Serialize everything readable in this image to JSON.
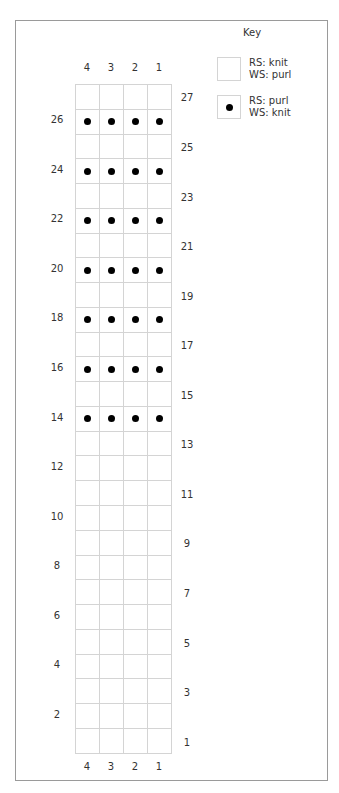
{
  "chart": {
    "columns": 4,
    "rows": 27,
    "column_labels_top": [
      "4",
      "3",
      "2",
      "1"
    ],
    "column_labels_bottom": [
      "4",
      "3",
      "2",
      "1"
    ],
    "purl_rows_rs": [
      14,
      16,
      18,
      20,
      22,
      24,
      26
    ],
    "row_labels_left": [
      "26",
      "24",
      "22",
      "20",
      "18",
      "16",
      "14",
      "12",
      "10",
      "8",
      "6",
      "4",
      "2"
    ],
    "row_labels_right": [
      "27",
      "25",
      "23",
      "21",
      "19",
      "17",
      "15",
      "13",
      "11",
      "9",
      "7",
      "5",
      "3",
      "1"
    ],
    "colors": {
      "grid_line": "#d4d4d4",
      "frame": "#9a9a9a",
      "dot": "#000000"
    }
  },
  "key": {
    "title": "Key",
    "items": [
      {
        "symbol": "empty-square",
        "label": "RS: knit\nWS: purl"
      },
      {
        "symbol": "dot",
        "label": "RS: purl\nWS: knit"
      }
    ]
  }
}
